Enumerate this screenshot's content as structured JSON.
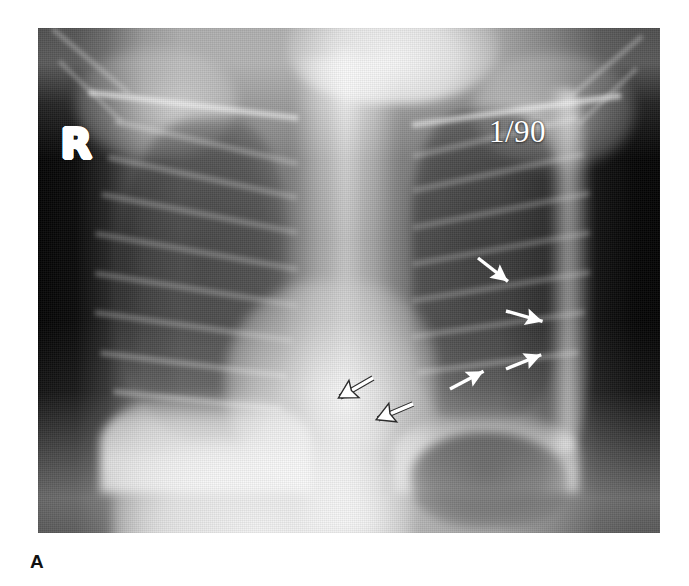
{
  "figure": {
    "label": "A",
    "modality": "chest-radiograph",
    "projection": "frontal-AP",
    "page_background": "#ffffff"
  },
  "radiograph": {
    "side_marker": "R",
    "date_stamp": "1/90",
    "marker_color": "#ffffff",
    "film_dark": "#050505",
    "film_mid": "#909090",
    "frame": {
      "left": 38,
      "top": 28,
      "width": 622,
      "height": 505
    }
  },
  "annotations": {
    "solid_arrows": [
      {
        "name": "solid-arrow-upper-1",
        "x": 69.5,
        "y": 46.5,
        "length": 52,
        "rotation": 218,
        "note": "left upper lung field"
      },
      {
        "name": "solid-arrow-upper-2",
        "x": 74.0,
        "y": 57.0,
        "length": 50,
        "rotation": 196,
        "note": "left mid lung field"
      },
      {
        "name": "solid-arrow-upper-3",
        "x": 74.0,
        "y": 68.5,
        "length": 48,
        "rotation": 158,
        "note": "left lower lateral"
      },
      {
        "name": "solid-arrow-lower-1",
        "x": 65.0,
        "y": 72.5,
        "length": 50,
        "rotation": 152,
        "note": "left paracardiac"
      }
    ],
    "outlined_arrows": [
      {
        "name": "outlined-arrow-1",
        "x": 52.0,
        "y": 69.5,
        "length": 54,
        "rotation": 330,
        "note": "retrocardiac margin medial"
      },
      {
        "name": "outlined-arrow-2",
        "x": 58.5,
        "y": 74.5,
        "length": 54,
        "rotation": 337,
        "note": "retrocardiac margin lateral"
      }
    ]
  },
  "anatomy": {
    "structures": [
      "neck-soft-tissue",
      "clavicle-right",
      "clavicle-left",
      "mediastinum",
      "spine-column",
      "cardiac-silhouette",
      "lung-right",
      "lung-left",
      "rib-cage",
      "diaphragm-right",
      "diaphragm-left",
      "gastric-bubble",
      "abdomen"
    ]
  }
}
